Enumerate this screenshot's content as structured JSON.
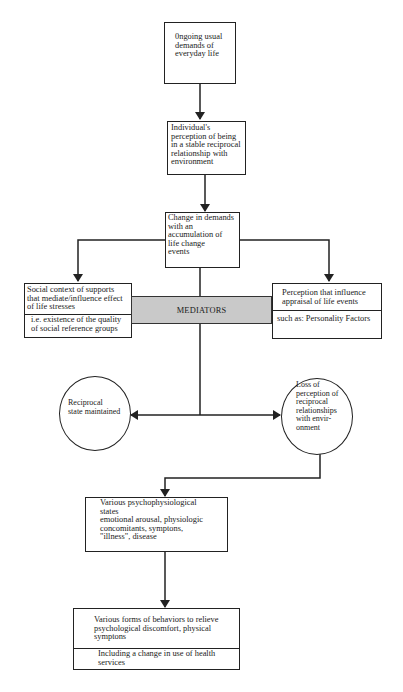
{
  "diagram": {
    "nodes": {
      "ongoing": {
        "text": "0ngoing usual\ndemands of\neveryday life"
      },
      "individual": {
        "text": "Individual's\nperception of being\nin a stable reciprocal\nrelationship with\nenvironment"
      },
      "change": {
        "text": "Change in demands\nwith an\naccumulation of\nlife change\nevents"
      },
      "social": {
        "top": "Social context of supports\nthat mediate/influence effect\nof life stresses",
        "bottom": "i.e. existence of the quality\nof social reference groups"
      },
      "mediators": {
        "text": "MEDIATORS"
      },
      "perception": {
        "top": "Perception that influence\nappraisal of life events",
        "bottom": "such as: Personality Factors"
      },
      "reciprocal": {
        "text": "Reciprocal\nstate maintained"
      },
      "loss": {
        "text": "Loss of\nperception of\nreciprocal\nrelationships\nwith  envir-\nonment"
      },
      "psycho": {
        "text": "Various psychophysiological\nstates\nemotional arousal, physiologic\nconcomitants, symptons,\n\"illness\", disease"
      },
      "behaviors": {
        "top": "Various forms of behaviors to relieve\npsychological discomfort, physical\nsymptons",
        "bottom": "Including a change in use of health\nservices"
      }
    },
    "colors": {
      "line": "#222222",
      "mediators_fill": "#c9c9c9"
    }
  }
}
